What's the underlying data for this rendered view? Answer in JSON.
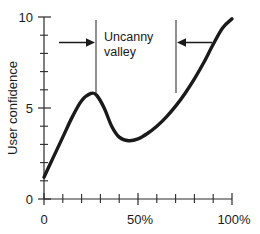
{
  "chart_data": {
    "type": "line",
    "title": "",
    "subtitle": "",
    "xlabel": "",
    "ylabel": "User confidence",
    "xlim": [
      0,
      100
    ],
    "ylim": [
      0,
      10
    ],
    "grid": false,
    "legend": null,
    "x_tick_labels": [
      "0",
      "50%",
      "100%"
    ],
    "x_tick_values": [
      0,
      50,
      100
    ],
    "x_minor_tick_values": [
      10,
      20,
      30,
      40,
      60,
      70,
      80,
      90
    ],
    "y_tick_labels": [
      "0",
      "5",
      "10"
    ],
    "y_tick_values": [
      0,
      5,
      10
    ],
    "y_minor_tick_values": [
      1,
      2,
      3,
      4,
      6,
      7,
      8,
      9
    ],
    "series": [
      {
        "name": "User confidence",
        "x": [
          0,
          5,
          10,
          15,
          20,
          25,
          28,
          32,
          36,
          40,
          45,
          50,
          55,
          60,
          65,
          70,
          75,
          80,
          85,
          90,
          95,
          100
        ],
        "y": [
          1.2,
          2.3,
          3.4,
          4.5,
          5.4,
          5.8,
          5.7,
          5.0,
          4.0,
          3.4,
          3.2,
          3.3,
          3.6,
          4.0,
          4.5,
          5.1,
          5.8,
          6.6,
          7.5,
          8.5,
          9.4,
          9.9
        ]
      }
    ],
    "annotations": [
      {
        "name": "uncanny-valley-label",
        "text_lines": [
          "Uncanny",
          "valley"
        ],
        "x_range": [
          28,
          66
        ],
        "type": "region-bracket",
        "arrows": [
          "right-pointing",
          "left-pointing"
        ]
      }
    ]
  },
  "annotation": {
    "line1": "Uncanny",
    "line2": "valley"
  },
  "axes": {
    "y_title": "User confidence",
    "x_labels": {
      "zero": "0",
      "fifty": "50%",
      "hundred": "100%"
    },
    "y_labels": {
      "zero": "0",
      "five": "5",
      "ten": "10"
    }
  },
  "colors": {
    "curve": "#1a1a1a",
    "axis": "#2b2b2b",
    "bracket": "#555555",
    "background": "#ffffff"
  }
}
